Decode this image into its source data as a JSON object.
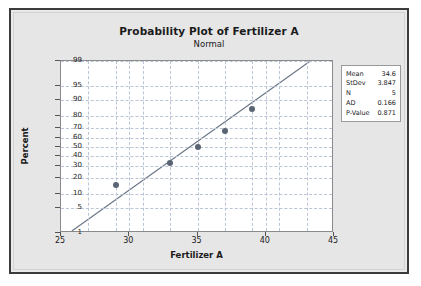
{
  "chart_data": {
    "type": "scatter",
    "title": "Probability Plot of Fertilizer A",
    "subtitle": "Normal",
    "xlabel": "Fertilizer A",
    "ylabel": "Percent",
    "grid": true,
    "xlim": [
      25,
      45
    ],
    "xticks": [
      25,
      30,
      35,
      40,
      45
    ],
    "yticks": [
      1,
      5,
      10,
      20,
      30,
      40,
      50,
      60,
      70,
      80,
      90,
      95,
      99
    ],
    "y_scale": "normal-probability",
    "points": [
      {
        "x": 29.0,
        "y": 15
      },
      {
        "x": 33.0,
        "y": 33
      },
      {
        "x": 35.0,
        "y": 50
      },
      {
        "x": 37.0,
        "y": 67
      },
      {
        "x": 39.0,
        "y": 85
      }
    ],
    "fit_line": {
      "x1": 25.8,
      "y1": 1,
      "x2": 43.4,
      "y2": 99
    },
    "legend_position": "right",
    "statistics": [
      {
        "label": "Mean",
        "value": "34.6"
      },
      {
        "label": "StDev",
        "value": "3.847"
      },
      {
        "label": "N",
        "value": "5"
      },
      {
        "label": "AD",
        "value": "0.166"
      },
      {
        "label": "P-Value",
        "value": "0.871"
      }
    ]
  }
}
